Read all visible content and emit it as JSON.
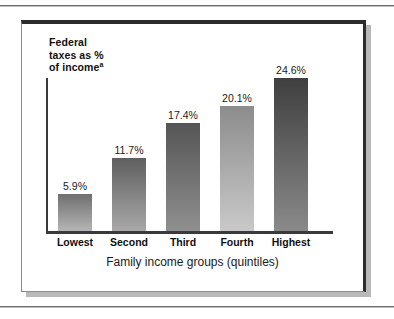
{
  "figure": {
    "y_caption_lines": [
      "Federal",
      "taxes as %",
      "of income"
    ],
    "y_caption_footnote": "a"
  },
  "chart_data": {
    "type": "bar",
    "title": "",
    "xlabel": "Family income groups (quintiles)",
    "ylabel": "Federal taxes as % of incomeᵃ",
    "categories": [
      "Lowest",
      "Second",
      "Third",
      "Fourth",
      "Highest"
    ],
    "values": [
      5.9,
      11.7,
      17.4,
      20.1,
      24.6
    ],
    "value_labels": [
      "5.9%",
      "11.7%",
      "17.4%",
      "20.1%",
      "24.6%"
    ],
    "ylim": [
      0,
      27
    ],
    "grid": false,
    "legend": "none",
    "bar_colors_top": [
      "#6f6f6f",
      "#5f5f5f",
      "#555555",
      "#8c8c8c",
      "#3f3f3f"
    ],
    "bar_colors_bottom": [
      "#b5b5b5",
      "#a8a8a8",
      "#8f8f8f",
      "#c9c9c9",
      "#8a8a8a"
    ]
  }
}
